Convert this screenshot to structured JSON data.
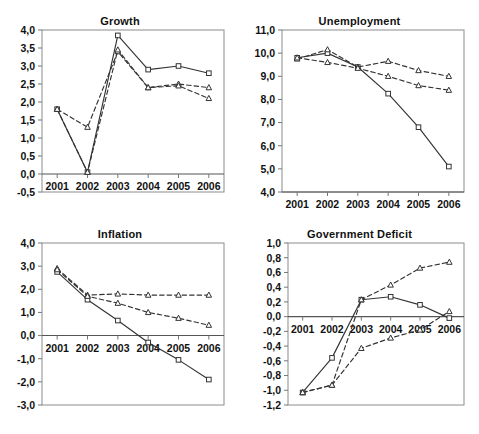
{
  "figure": {
    "background": "#ffffff",
    "line_color": "#333333",
    "marker_fill": "#ffffff",
    "frame_color": "#8c8c8c",
    "panel_count": 4
  },
  "chart_data": [
    {
      "type": "line",
      "name": "growth",
      "title": "Growth",
      "xlabel": "",
      "ylabel": "",
      "categories": [
        "2001",
        "2002",
        "2003",
        "2004",
        "2005",
        "2006"
      ],
      "ylim": [
        -0.5,
        4.0
      ],
      "yticks": [
        -0.5,
        0.0,
        0.5,
        1.0,
        1.5,
        2.0,
        2.5,
        3.0,
        3.5,
        4.0
      ],
      "ytick_labels": [
        "-0,5",
        "0,0",
        "0,5",
        "1,0",
        "1,5",
        "2,0",
        "2,5",
        "3,0",
        "3,5",
        "4,0"
      ],
      "xaxis_value": 0.0,
      "grid": false,
      "legend": "none",
      "series": [
        {
          "name": "series-solid-square",
          "style": "solid",
          "marker": "square",
          "values": [
            1.8,
            0.05,
            3.85,
            2.9,
            3.0,
            2.8
          ]
        },
        {
          "name": "series-dashed-triangle-a",
          "style": "dashed",
          "marker": "triangle",
          "values": [
            1.8,
            1.3,
            3.4,
            2.4,
            2.5,
            2.4
          ]
        },
        {
          "name": "series-dashed-triangle-b",
          "style": "dashed",
          "marker": "triangle",
          "values": [
            1.8,
            0.05,
            3.45,
            2.4,
            2.45,
            2.1
          ]
        }
      ]
    },
    {
      "type": "line",
      "name": "unemployment",
      "title": "Unemployment",
      "xlabel": "",
      "ylabel": "",
      "categories": [
        "2001",
        "2002",
        "2003",
        "2004",
        "2005",
        "2006"
      ],
      "ylim": [
        4.0,
        11.0
      ],
      "yticks": [
        4.0,
        5.0,
        6.0,
        7.0,
        8.0,
        9.0,
        10.0,
        11.0
      ],
      "ytick_labels": [
        "4,0",
        "5,0",
        "6,0",
        "7,0",
        "8,0",
        "9,0",
        "10,0",
        "11,0"
      ],
      "xaxis_value": 4.0,
      "grid": false,
      "legend": "none",
      "series": [
        {
          "name": "series-solid-square",
          "style": "solid",
          "marker": "square",
          "values": [
            9.8,
            10.0,
            9.4,
            8.25,
            6.8,
            5.1
          ]
        },
        {
          "name": "series-dashed-triangle-a",
          "style": "dashed",
          "marker": "triangle",
          "values": [
            9.75,
            10.15,
            9.4,
            9.65,
            9.25,
            9.0
          ]
        },
        {
          "name": "series-dashed-triangle-b",
          "style": "dashed",
          "marker": "triangle",
          "values": [
            9.8,
            9.6,
            9.35,
            9.0,
            8.6,
            8.4
          ]
        }
      ]
    },
    {
      "type": "line",
      "name": "inflation",
      "title": "Inflation",
      "xlabel": "",
      "ylabel": "",
      "categories": [
        "2001",
        "2002",
        "2003",
        "2004",
        "2005",
        "2006"
      ],
      "ylim": [
        -3.0,
        4.0
      ],
      "yticks": [
        -3.0,
        -2.0,
        -1.0,
        0.0,
        1.0,
        2.0,
        3.0,
        4.0
      ],
      "ytick_labels": [
        "-3,0",
        "-2,0",
        "-1,0",
        "0,0",
        "1,0",
        "2,0",
        "3,0",
        "4,0"
      ],
      "xaxis_value": 0.0,
      "grid": false,
      "legend": "none",
      "series": [
        {
          "name": "series-solid-square",
          "style": "solid",
          "marker": "square",
          "values": [
            2.75,
            1.55,
            0.65,
            -0.3,
            -1.05,
            -1.9
          ]
        },
        {
          "name": "series-dashed-triangle-a",
          "style": "dashed",
          "marker": "triangle",
          "values": [
            2.9,
            1.75,
            1.8,
            1.75,
            1.75,
            1.75
          ]
        },
        {
          "name": "series-dashed-triangle-b",
          "style": "dashed",
          "marker": "triangle",
          "values": [
            2.85,
            1.7,
            1.4,
            1.0,
            0.75,
            0.45
          ]
        }
      ]
    },
    {
      "type": "line",
      "name": "government-deficit",
      "title": "Government Deficit",
      "xlabel": "",
      "ylabel": "",
      "categories": [
        "2001",
        "2002",
        "2003",
        "2004",
        "2005",
        "2006"
      ],
      "ylim": [
        -1.2,
        1.0
      ],
      "yticks": [
        -1.2,
        -1.0,
        -0.8,
        -0.6,
        -0.4,
        -0.2,
        0.0,
        0.2,
        0.4,
        0.6,
        0.8,
        1.0
      ],
      "ytick_labels": [
        "-1,2",
        "-1,0",
        "-0,8",
        "-0,6",
        "-0,4",
        "-0,2",
        "0,0",
        "0,2",
        "0,4",
        "0,6",
        "0,8",
        "1,0"
      ],
      "xaxis_value": 0.0,
      "grid": false,
      "legend": "none",
      "series": [
        {
          "name": "series-solid-square",
          "style": "solid",
          "marker": "square",
          "values": [
            -1.03,
            -0.56,
            0.23,
            0.27,
            0.16,
            -0.02
          ]
        },
        {
          "name": "series-dashed-triangle-a",
          "style": "dashed",
          "marker": "triangle",
          "values": [
            -1.03,
            -0.93,
            0.23,
            0.43,
            0.66,
            0.74
          ]
        },
        {
          "name": "series-dashed-triangle-b",
          "style": "dashed",
          "marker": "triangle",
          "values": [
            -1.03,
            -0.93,
            -0.43,
            -0.29,
            -0.18,
            0.07
          ]
        }
      ]
    }
  ]
}
